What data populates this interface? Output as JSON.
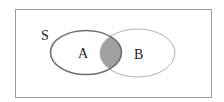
{
  "diagram": {
    "type": "venn",
    "universe_label": "S",
    "sets": [
      {
        "label": "A"
      },
      {
        "label": "B"
      }
    ],
    "shaded_region": "A ∩ B",
    "colors": {
      "border": "#9a9a9a",
      "set_a_stroke": "#6e6e6e",
      "set_b_stroke": "#b0b0b0",
      "intersection_fill": "#a0a0a0"
    }
  }
}
